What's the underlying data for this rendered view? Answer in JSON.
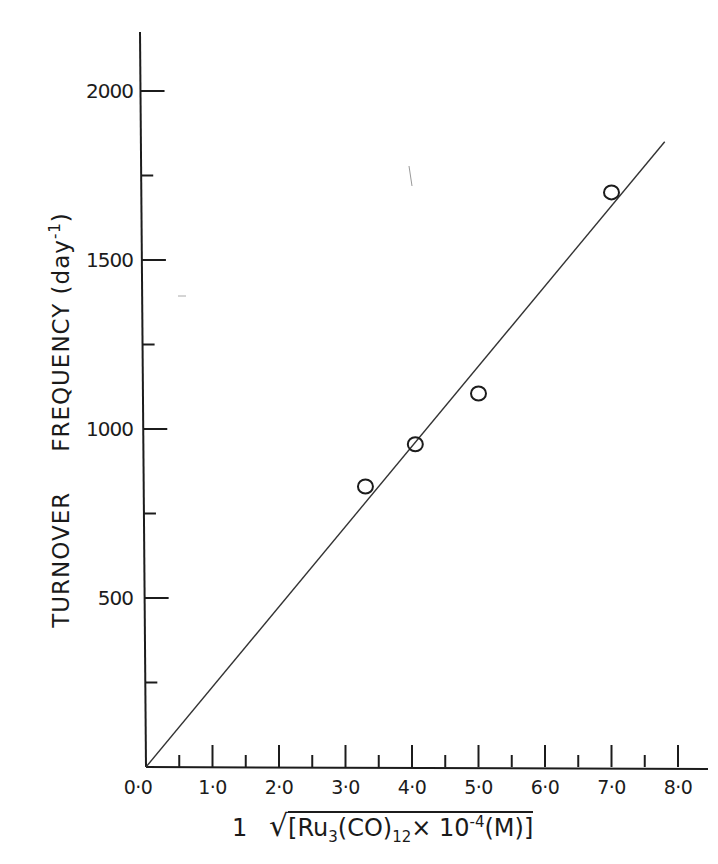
{
  "chart_data": {
    "type": "scatter",
    "title": "",
    "xlabel": "1 / √[Ru3(CO)12 × 10^-4 (M)]",
    "ylabel": "TURNOVER FREQUENCY (day^-1)",
    "xlim": [
      0,
      8
    ],
    "ylim": [
      0,
      2200
    ],
    "grid": false,
    "legend": null,
    "x_ticks": [
      "0·0",
      "1·0",
      "2·0",
      "3·0",
      "4·0",
      "5·0",
      "6·0",
      "7·0",
      "8·0"
    ],
    "y_ticks": [
      "500",
      "1000",
      "1500",
      "2000"
    ],
    "series": [
      {
        "name": "data points",
        "marker": "open-circle",
        "x": [
          3.3,
          4.05,
          5.0,
          7.0
        ],
        "y": [
          830,
          955,
          1105,
          1700
        ]
      },
      {
        "name": "linear fit",
        "style": "line",
        "x": [
          0.0,
          7.8
        ],
        "y": [
          0,
          1850
        ]
      }
    ]
  },
  "axes": {
    "y_label_part1": "TURNOVER",
    "y_label_part2": "FREQUENCY",
    "y_label_unit": "(day",
    "y_label_unit_sup": "-1",
    "y_label_close": ")",
    "x_label_prefix": "1",
    "x_label_ru": "Ru",
    "x_label_sub3": "3",
    "x_label_co": "(CO)",
    "x_label_sub12": "12",
    "x_label_times": "× 10",
    "x_label_sup": "-4",
    "x_label_unit": "(M)"
  },
  "colors": {
    "ink": "#1c1c1c",
    "background": "#ffffff"
  }
}
